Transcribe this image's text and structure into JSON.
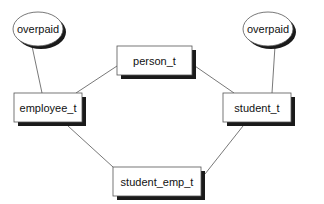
{
  "diagram": {
    "type": "type-hierarchy",
    "nodes": [
      {
        "id": "person_t",
        "label": "person_t",
        "shape": "box",
        "x": 117,
        "y": 46,
        "w": 75,
        "h": 29
      },
      {
        "id": "employee_t",
        "label": "employee_t",
        "shape": "box",
        "x": 14,
        "y": 93,
        "w": 68,
        "h": 29
      },
      {
        "id": "student_t",
        "label": "student_t",
        "shape": "box",
        "x": 223,
        "y": 93,
        "w": 68,
        "h": 29
      },
      {
        "id": "student_emp_t",
        "label": "student_emp_t",
        "shape": "box",
        "x": 113,
        "y": 167,
        "w": 88,
        "h": 29
      },
      {
        "id": "overpaid_left",
        "label": "overpaid",
        "shape": "ellipse",
        "cx": 38,
        "cy": 29,
        "rx": 25,
        "ry": 17
      },
      {
        "id": "overpaid_right",
        "label": "overpaid",
        "shape": "ellipse",
        "cx": 268,
        "cy": 29,
        "rx": 25,
        "ry": 17
      }
    ],
    "edges": [
      {
        "from": "overpaid_left",
        "to": "employee_t",
        "x1": 32,
        "y1": 46,
        "x2": 42,
        "y2": 93
      },
      {
        "from": "overpaid_right",
        "to": "student_t",
        "x1": 275,
        "y1": 46,
        "x2": 272,
        "y2": 93
      },
      {
        "from": "person_t",
        "to": "employee_t",
        "x1": 117,
        "y1": 66,
        "x2": 76,
        "y2": 93
      },
      {
        "from": "person_t",
        "to": "student_t",
        "x1": 192,
        "y1": 64,
        "x2": 234,
        "y2": 93
      },
      {
        "from": "employee_t",
        "to": "student_emp_t",
        "x1": 68,
        "y1": 126,
        "x2": 113,
        "y2": 167
      },
      {
        "from": "student_t",
        "to": "student_emp_t",
        "x1": 243,
        "y1": 126,
        "x2": 205,
        "y2": 174
      }
    ],
    "colors": {
      "stroke": "#555555",
      "fill": "#ffffff",
      "shadow": "#1a1a1a",
      "text": "#111111"
    }
  }
}
